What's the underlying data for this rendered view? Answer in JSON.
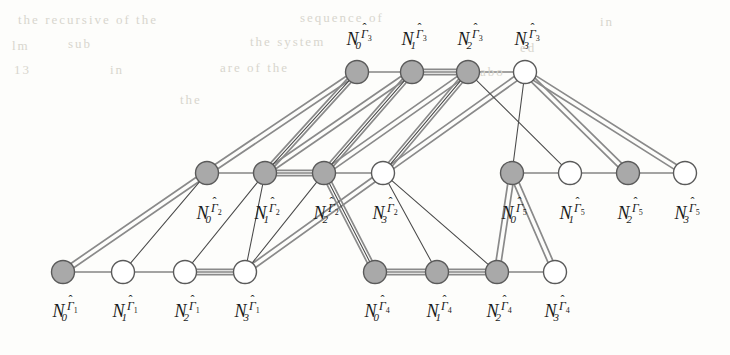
{
  "figure": {
    "background_color": "#fdfdfb",
    "node_fill_gray": "#a9a9a9",
    "node_fill_white": "#ffffff",
    "node_stroke": "#5a5a5a",
    "edge_thin_color": "#4a4a4a",
    "edge_thick_color": "#8a8a8a",
    "node_radius": 11.5
  },
  "groups": [
    {
      "id": "gamma1",
      "group_symbol": "Γ",
      "group_index": "1",
      "row": "bottom-left",
      "nodes": [
        {
          "id": "g1n0",
          "index": "0",
          "x": 63,
          "y": 272,
          "fill": "gray",
          "label": "N_0^{Γ̂1}"
        },
        {
          "id": "g1n1",
          "index": "1",
          "x": 123,
          "y": 272,
          "fill": "white",
          "label": "N_1^{Γ̂1}"
        },
        {
          "id": "g1n2",
          "index": "2",
          "x": 185,
          "y": 272,
          "fill": "white",
          "label": "N_2^{Γ̂1}"
        },
        {
          "id": "g1n3",
          "index": "3",
          "x": 245,
          "y": 272,
          "fill": "white",
          "label": "N_3^{Γ̂1}"
        }
      ],
      "labels_y": 300
    },
    {
      "id": "gamma2",
      "group_symbol": "Γ",
      "group_index": "2",
      "row": "middle-left",
      "nodes": [
        {
          "id": "g2n0",
          "index": "0",
          "x": 207,
          "y": 173,
          "fill": "gray",
          "label": "N_0^{Γ̂2}"
        },
        {
          "id": "g2n1",
          "index": "1",
          "x": 265,
          "y": 173,
          "fill": "gray",
          "label": "N_1^{Γ̂2}"
        },
        {
          "id": "g2n2",
          "index": "2",
          "x": 324,
          "y": 173,
          "fill": "gray",
          "label": "N_2^{Γ̂2}"
        },
        {
          "id": "g2n3",
          "index": "3",
          "x": 383,
          "y": 173,
          "fill": "white",
          "label": "N_3^{Γ̂2}"
        }
      ],
      "labels_y": 202
    },
    {
      "id": "gamma3",
      "group_symbol": "Γ",
      "group_index": "3",
      "row": "top",
      "nodes": [
        {
          "id": "g3n0",
          "index": "0",
          "x": 357,
          "y": 72,
          "fill": "gray",
          "label": "N_0^{Γ̂3}"
        },
        {
          "id": "g3n1",
          "index": "1",
          "x": 412,
          "y": 72,
          "fill": "gray",
          "label": "N_1^{Γ̂3}"
        },
        {
          "id": "g3n2",
          "index": "2",
          "x": 468,
          "y": 72,
          "fill": "gray",
          "label": "N_2^{Γ̂3}"
        },
        {
          "id": "g3n3",
          "index": "3",
          "x": 525,
          "y": 72,
          "fill": "white",
          "label": "N_3^{Γ̂3}"
        }
      ],
      "labels_y": 28
    },
    {
      "id": "gamma4",
      "group_symbol": "Γ",
      "group_index": "4",
      "row": "bottom-right",
      "nodes": [
        {
          "id": "g4n0",
          "index": "0",
          "x": 375,
          "y": 272,
          "fill": "gray",
          "label": "N_0^{Γ̂4}"
        },
        {
          "id": "g4n1",
          "index": "1",
          "x": 437,
          "y": 272,
          "fill": "gray",
          "label": "N_1^{Γ̂4}"
        },
        {
          "id": "g4n2",
          "index": "2",
          "x": 497,
          "y": 272,
          "fill": "gray",
          "label": "N_2^{Γ̂4}"
        },
        {
          "id": "g4n3",
          "index": "3",
          "x": 555,
          "y": 272,
          "fill": "white",
          "label": "N_3^{Γ̂4}"
        }
      ],
      "labels_y": 300
    },
    {
      "id": "gamma5",
      "group_symbol": "Γ",
      "group_index": "5",
      "row": "middle-right",
      "nodes": [
        {
          "id": "g5n0",
          "index": "0",
          "x": 512,
          "y": 173,
          "fill": "gray",
          "label": "N_0^{Γ̂5}"
        },
        {
          "id": "g5n1",
          "index": "1",
          "x": 570,
          "y": 173,
          "fill": "white",
          "label": "N_1^{Γ̂5}"
        },
        {
          "id": "g5n2",
          "index": "2",
          "x": 628,
          "y": 173,
          "fill": "gray",
          "label": "N_2^{Γ̂5}"
        },
        {
          "id": "g5n3",
          "index": "3",
          "x": 685,
          "y": 173,
          "fill": "white",
          "label": "N_3^{Γ̂5}"
        }
      ],
      "labels_y": 202
    }
  ],
  "edges_thin": [
    [
      "g1n0",
      "g1n1"
    ],
    [
      "g1n1",
      "g1n2"
    ],
    [
      "g1n2",
      "g1n3"
    ],
    [
      "g4n0",
      "g4n1"
    ],
    [
      "g4n1",
      "g4n2"
    ],
    [
      "g4n2",
      "g4n3"
    ],
    [
      "g2n0",
      "g2n1"
    ],
    [
      "g2n1",
      "g2n2"
    ],
    [
      "g2n2",
      "g2n3"
    ],
    [
      "g5n0",
      "g5n1"
    ],
    [
      "g5n1",
      "g5n2"
    ],
    [
      "g5n2",
      "g5n3"
    ],
    [
      "g3n0",
      "g3n1"
    ],
    [
      "g3n1",
      "g3n2"
    ],
    [
      "g3n2",
      "g3n3"
    ],
    [
      "g1n1",
      "g2n0"
    ],
    [
      "g1n2",
      "g2n1"
    ],
    [
      "g1n3",
      "g2n2"
    ],
    [
      "g2n1",
      "g1n3"
    ],
    [
      "g2n2",
      "g4n0"
    ],
    [
      "g3n1",
      "g2n2"
    ],
    [
      "g3n2",
      "g2n3"
    ],
    [
      "g3n0",
      "g2n1"
    ],
    [
      "g3n3",
      "g5n0"
    ],
    [
      "g3n2",
      "g5n1"
    ],
    [
      "g2n3",
      "g4n1"
    ],
    [
      "g2n3",
      "g4n2"
    ]
  ],
  "edges_thick": [
    [
      "g1n0",
      "g2n0"
    ],
    [
      "g1n3",
      "g2n3"
    ],
    [
      "g1n2",
      "g1n3"
    ],
    [
      "g2n0",
      "g3n0"
    ],
    [
      "g2n1",
      "g3n0"
    ],
    [
      "g2n1",
      "g3n1"
    ],
    [
      "g2n2",
      "g3n1"
    ],
    [
      "g2n2",
      "g3n2"
    ],
    [
      "g2n3",
      "g3n2"
    ],
    [
      "g2n3",
      "g3n3"
    ],
    [
      "g2n1",
      "g2n2"
    ],
    [
      "g3n1",
      "g3n2"
    ],
    [
      "g3n3",
      "g5n3"
    ],
    [
      "g3n3",
      "g5n2"
    ],
    [
      "g4n0",
      "g2n2"
    ],
    [
      "g4n0",
      "g4n1"
    ],
    [
      "g4n1",
      "g4n2"
    ],
    [
      "g4n2",
      "g5n0"
    ],
    [
      "g4n3",
      "g5n0"
    ]
  ],
  "background_ghost_text": [
    {
      "text": "the  recursive  of  the",
      "x": 18,
      "y": 12
    },
    {
      "text": "sequence  of",
      "x": 300,
      "y": 10
    },
    {
      "text": "in",
      "x": 600,
      "y": 14
    },
    {
      "text": "lm",
      "x": 12,
      "y": 38
    },
    {
      "text": "sub",
      "x": 68,
      "y": 36
    },
    {
      "text": "the  system",
      "x": 250,
      "y": 34
    },
    {
      "text": "ed",
      "x": 520,
      "y": 40
    },
    {
      "text": "13",
      "x": 14,
      "y": 62
    },
    {
      "text": "in",
      "x": 110,
      "y": 62
    },
    {
      "text": "are  of  the",
      "x": 220,
      "y": 60
    },
    {
      "text": "abo",
      "x": 480,
      "y": 64
    },
    {
      "text": "the",
      "x": 180,
      "y": 92
    }
  ]
}
